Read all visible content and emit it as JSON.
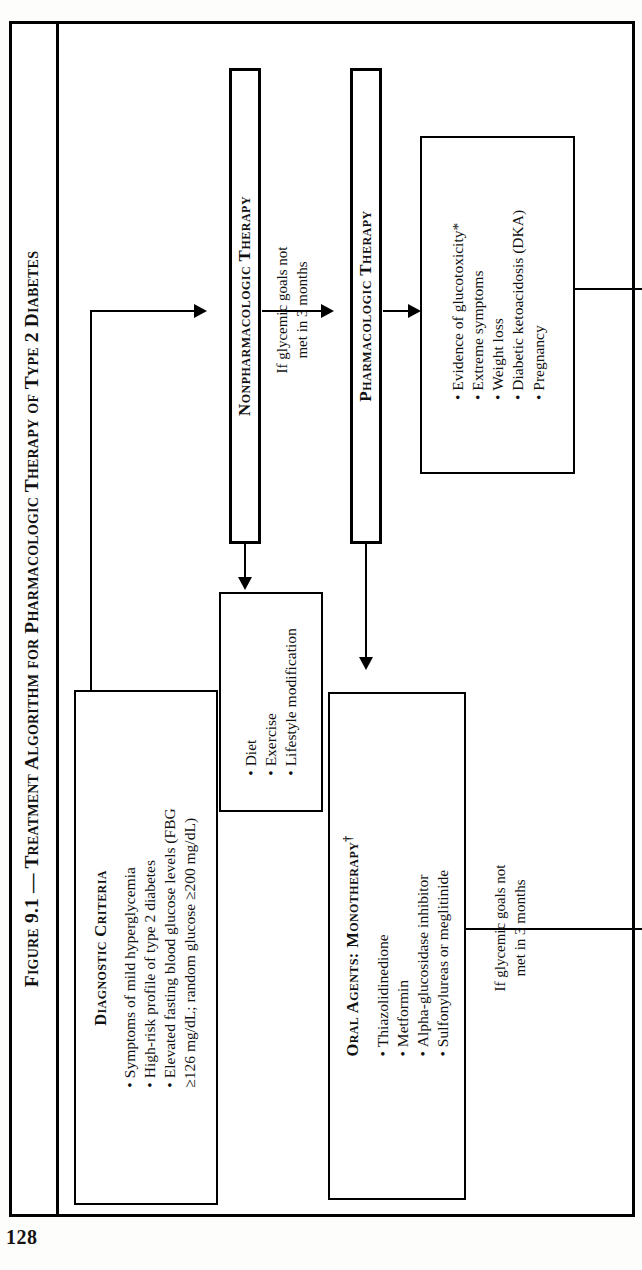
{
  "page": {
    "folio": "128"
  },
  "figure": {
    "title": "Figure 9.1 — Treatment Algorithm for Pharmacologic Therapy of Type 2 Diabetes",
    "title_parts": {
      "label": "Figure 9.1",
      "dash": "—",
      "rest": "Treatment Algorithm for Pharmacologic Therapy of Type 2 Diabetes"
    }
  },
  "nodes": {
    "diagnostic_criteria": {
      "header": "Diagnostic Criteria",
      "bullets": [
        "Symptoms of mild hyperglycemia",
        "High-risk profile of type 2 diabetes",
        "Elevated fasting blood glucose levels (FBG",
        "≥126 mg/dL; random glucose ≥200 mg/dL)"
      ]
    },
    "nonpharmacologic_therapy": {
      "label": "Nonpharmacologic Therapy"
    },
    "lifestyle": {
      "bullets": [
        "Diet",
        "Exercise",
        "Lifestyle modification"
      ]
    },
    "pharmacologic_therapy": {
      "label": "Pharmacologic Therapy"
    },
    "indications": {
      "bullets": [
        "Evidence of glucotoxicity*",
        "Extreme symptoms",
        "Weight loss",
        "Diabetic ketoacidosis (DKA)",
        "Pregnancy"
      ]
    },
    "oral_agents": {
      "header": "Oral Agents: Monotherapy",
      "header_marker": "†",
      "bullets": [
        "Thiazolidinedione",
        "Metformin",
        "Alpha-glucosidase inhibitor",
        "Sulfonylureas or meglitinide"
      ]
    }
  },
  "connectors": {
    "glycemic_upper": {
      "line1": "If glycemic goals not",
      "line2": "met in 3 months"
    },
    "glycemic_lower": {
      "line1": "If glycemic goals not",
      "line2": "met in 3 months"
    }
  },
  "colors": {
    "ink": "#000000",
    "paper": "#ffffff"
  }
}
